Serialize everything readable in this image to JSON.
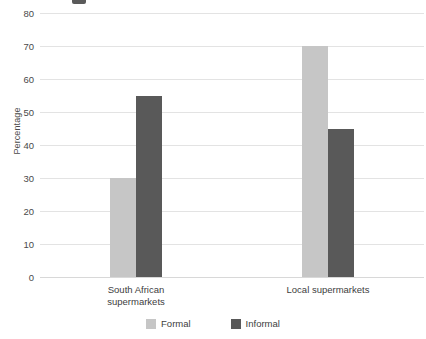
{
  "chart_data": {
    "type": "bar",
    "title": "",
    "xlabel": "",
    "ylabel": "Percentage",
    "ylim": [
      0,
      80
    ],
    "yticks": [
      0,
      10,
      20,
      30,
      40,
      50,
      60,
      70,
      80
    ],
    "grid": "horizontal",
    "legend_position": "bottom-center",
    "categories": [
      "South African\nsupermarkets",
      "Local supermarkets"
    ],
    "series": [
      {
        "name": "Formal",
        "color": "#c6c6c6",
        "values": [
          30,
          70
        ]
      },
      {
        "name": "Informal",
        "color": "#595959",
        "values": [
          55,
          45
        ]
      }
    ]
  },
  "axis": {
    "y_title": "Percentage",
    "ticks": [
      {
        "label": "80",
        "value": 80
      },
      {
        "label": "70",
        "value": 70
      },
      {
        "label": "60",
        "value": 60
      },
      {
        "label": "50",
        "value": 50
      },
      {
        "label": "40",
        "value": 40
      },
      {
        "label": "30",
        "value": 30
      },
      {
        "label": "20",
        "value": 20
      },
      {
        "label": "10",
        "value": 10
      },
      {
        "label": "0",
        "value": 0
      }
    ]
  },
  "categories": [
    {
      "label": "South African\nsupermarkets"
    },
    {
      "label": "Local supermarkets"
    }
  ],
  "legend": {
    "items": [
      {
        "label": "Formal",
        "color": "#c6c6c6"
      },
      {
        "label": "Informal",
        "color": "#595959"
      }
    ]
  },
  "colors": {
    "formal": "#c6c6c6",
    "informal": "#595959",
    "gridline": "#e3e3e3",
    "text": "#404040",
    "background": "#ffffff"
  }
}
